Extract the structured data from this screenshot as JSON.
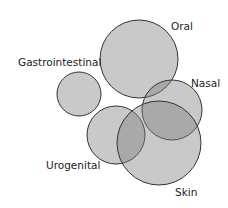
{
  "diagram": {
    "type": "venn-like overlapping circles",
    "fill_color": "#7f7f7f",
    "fill_opacity": 0.42,
    "stroke_color": "#333333",
    "circles": [
      {
        "id": "oral",
        "label": "Oral",
        "cx": 139,
        "cy": 59,
        "r": 39,
        "label_x": 171,
        "label_y": 30
      },
      {
        "id": "gastrointestinal",
        "label": "Gastrointestinal",
        "cx": 79,
        "cy": 94,
        "r": 22,
        "label_x": 18,
        "label_y": 66
      },
      {
        "id": "nasal",
        "label": "Nasal",
        "cx": 172,
        "cy": 110,
        "r": 30,
        "label_x": 191,
        "label_y": 87
      },
      {
        "id": "urogenital",
        "label": "Urogenital",
        "cx": 116,
        "cy": 135,
        "r": 29,
        "label_x": 46,
        "label_y": 169
      },
      {
        "id": "skin",
        "label": "Skin",
        "cx": 159,
        "cy": 143,
        "r": 42,
        "label_x": 175,
        "label_y": 196
      }
    ]
  }
}
